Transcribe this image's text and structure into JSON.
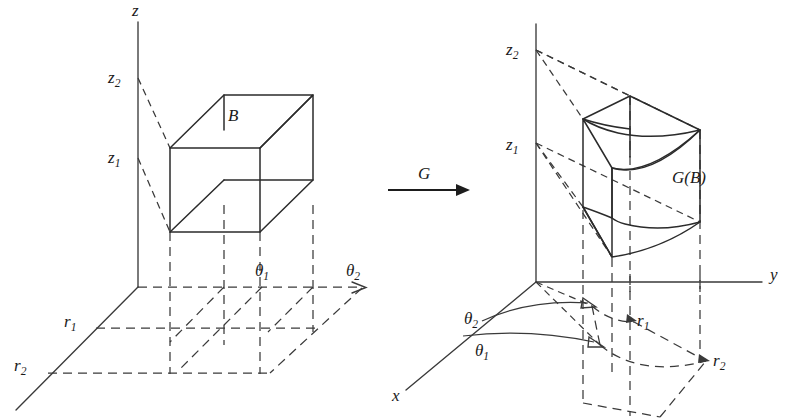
{
  "figure": {
    "background_color": "#ffffff",
    "ink_color": "#2b2b2b",
    "dashed_color": "#3a3a3a",
    "width": 789,
    "height": 419
  },
  "mapping": {
    "arrow_label": "G",
    "arrow_glyph": "→",
    "direction": "left-to-right"
  },
  "left_panel": {
    "caption": "Domain: rectangular box in (r, theta, z) parameter space",
    "region_label": "B",
    "axes": [
      {
        "name": "z-axis",
        "label": "z",
        "label_x": 132,
        "label_y": 16
      },
      {
        "name": "theta-axis",
        "label": "θ",
        "label_x": 0,
        "label_y": 0
      },
      {
        "name": "r-axis",
        "label": "r",
        "label_x": 0,
        "label_y": 0
      }
    ],
    "tick_labels": [
      {
        "name": "z1",
        "base": "z",
        "sub": "1",
        "x": 111,
        "y": 163
      },
      {
        "name": "z2",
        "base": "z",
        "sub": "2",
        "x": 111,
        "y": 83
      },
      {
        "name": "r1",
        "base": "r",
        "sub": "1",
        "x": 66,
        "y": 327
      },
      {
        "name": "r2",
        "base": "r",
        "sub": "2",
        "x": 16,
        "y": 371
      },
      {
        "name": "theta1",
        "base": "θ",
        "sub": "1",
        "x": 257,
        "y": 276
      },
      {
        "name": "theta2",
        "base": "θ",
        "sub": "2",
        "x": 348,
        "y": 276
      }
    ]
  },
  "right_panel": {
    "caption": "Image: curved wedge G(B) in Cartesian (x, y, z) space",
    "region_label": "G(B)",
    "region_label_x": 690,
    "region_label_y": 180,
    "axes": [
      {
        "name": "z-axis",
        "label": "z",
        "label_x": 0,
        "label_y": 0
      },
      {
        "name": "y-axis",
        "label": "y",
        "label_x": 771,
        "label_y": 280
      },
      {
        "name": "x-axis",
        "label": "x",
        "label_x": 394,
        "label_y": 400
      }
    ],
    "tick_labels": [
      {
        "name": "z1",
        "base": "z",
        "sub": "1",
        "x": 509,
        "y": 150
      },
      {
        "name": "z2",
        "base": "z",
        "sub": "2",
        "x": 509,
        "y": 55
      },
      {
        "name": "r1",
        "base": "r",
        "sub": "1",
        "x": 639,
        "y": 326
      },
      {
        "name": "r2",
        "base": "r",
        "sub": "2",
        "x": 715,
        "y": 366
      },
      {
        "name": "theta1",
        "base": "θ",
        "sub": "1",
        "x": 477,
        "y": 356
      },
      {
        "name": "theta2",
        "base": "θ",
        "sub": "2",
        "x": 466,
        "y": 324
      }
    ]
  }
}
